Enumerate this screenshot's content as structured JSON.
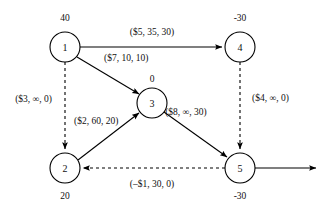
{
  "diagram": {
    "type": "network-flow-graph",
    "title": "",
    "nodes": [
      {
        "id": "1",
        "label": "1",
        "supply": "40",
        "cx": 65,
        "cy": 47,
        "r": 15,
        "supply_x": 65,
        "supply_y": 21
      },
      {
        "id": "2",
        "label": "2",
        "supply": "20",
        "cx": 65,
        "cy": 168,
        "r": 15,
        "supply_x": 65,
        "supply_y": 199
      },
      {
        "id": "3",
        "label": "3",
        "supply": "0",
        "cx": 152,
        "cy": 103,
        "r": 15,
        "supply_x": 152,
        "supply_y": 82
      },
      {
        "id": "4",
        "label": "4",
        "supply": "-30",
        "cx": 240,
        "cy": 47,
        "r": 15,
        "supply_x": 240,
        "supply_y": 21
      },
      {
        "id": "5",
        "label": "5",
        "supply": "-30",
        "cx": 240,
        "cy": 168,
        "r": 15,
        "supply_x": 240,
        "supply_y": 199
      }
    ],
    "edges": [
      {
        "id": "edge-1-4",
        "from": "1",
        "to": "4",
        "style": "solid",
        "label": "($5, 35, 30)",
        "cost": "$5",
        "capacity": "35",
        "flow": "30",
        "label_x": 152,
        "label_y": 35,
        "label_anchor": "middle"
      },
      {
        "id": "edge-1-3",
        "from": "1",
        "to": "3",
        "style": "solid",
        "label": "($7, 10, 10)",
        "cost": "$7",
        "capacity": "10",
        "flow": "10",
        "label_x": 104,
        "label_y": 61,
        "label_anchor": "start"
      },
      {
        "id": "edge-1-2",
        "from": "1",
        "to": "2",
        "style": "dashed",
        "label": "($3, ∞, 0)",
        "cost": "$3",
        "capacity": "∞",
        "flow": "0",
        "label_x": 52,
        "label_y": 102,
        "label_anchor": "end"
      },
      {
        "id": "edge-2-3",
        "from": "2",
        "to": "3",
        "style": "solid",
        "label": "($2, 60, 20)",
        "cost": "$2",
        "capacity": "60",
        "flow": "20",
        "label_x": 74,
        "label_y": 124,
        "label_anchor": "start"
      },
      {
        "id": "edge-3-5",
        "from": "3",
        "to": "5",
        "style": "solid",
        "label": "($8, ∞, 30)",
        "cost": "$8",
        "capacity": "∞",
        "flow": "30",
        "label_x": 186,
        "label_y": 115,
        "label_anchor": "middle"
      },
      {
        "id": "edge-4-5",
        "from": "4",
        "to": "5",
        "style": "dashed",
        "label": "($4, ∞, 0)",
        "cost": "$4",
        "capacity": "∞",
        "flow": "0",
        "label_x": 252,
        "label_y": 101,
        "label_anchor": "start"
      },
      {
        "id": "edge-5-2",
        "from": "5",
        "to": "2",
        "style": "dashed",
        "label": "(–$1, 30, 0)",
        "cost": "–$1",
        "capacity": "30",
        "flow": "0",
        "label_x": 152,
        "label_y": 187,
        "label_anchor": "middle"
      },
      {
        "id": "edge-5-out",
        "from": "5",
        "to": "",
        "style": "solid",
        "label": "",
        "cost": "",
        "capacity": "",
        "flow": "",
        "label_x": 0,
        "label_y": 0,
        "label_anchor": "middle"
      }
    ],
    "colors": {
      "stroke": "#000000",
      "background": "#ffffff",
      "text": "#111111"
    }
  }
}
